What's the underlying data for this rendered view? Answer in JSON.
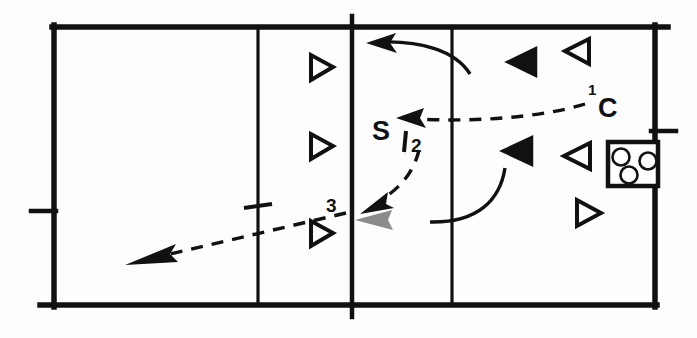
{
  "diagram": {
    "type": "court-drill",
    "court": {
      "outline": {
        "x": 52,
        "y": 25,
        "width": 603,
        "height": 280
      },
      "net_line_x": 352,
      "attack_line_left_x": 258,
      "attack_line_right_x": 452,
      "line_color": "#111111",
      "background_color": "#ffffff"
    },
    "labels": [
      {
        "id": "label-c",
        "text": "C",
        "role": "coach",
        "x": 607,
        "y": 113,
        "size": "big"
      },
      {
        "id": "label-c-sup",
        "text": "1",
        "role": "sequence-marker",
        "x": 590,
        "y": 94,
        "size": "sup"
      },
      {
        "id": "label-s",
        "text": "S",
        "role": "setter",
        "x": 378,
        "y": 135,
        "size": "big"
      },
      {
        "id": "label-2",
        "text": "2",
        "role": "sequence-marker",
        "x": 417,
        "y": 151,
        "size": "mid"
      },
      {
        "id": "label-3",
        "text": "3",
        "role": "sequence-marker",
        "x": 330,
        "y": 209,
        "size": "mid"
      }
    ],
    "players": [
      {
        "id": "player-open-right-1",
        "style": "hollow",
        "direction": "right",
        "x": 310,
        "y": 55
      },
      {
        "id": "player-open-right-2",
        "style": "hollow",
        "direction": "right",
        "x": 310,
        "y": 134
      },
      {
        "id": "player-open-right-3",
        "style": "hollow",
        "direction": "right",
        "x": 310,
        "y": 221
      },
      {
        "id": "player-filled-left-1",
        "style": "filled",
        "direction": "left",
        "x": 535,
        "y": 48
      },
      {
        "id": "player-filled-left-2",
        "style": "filled",
        "direction": "left",
        "x": 531,
        "y": 137
      },
      {
        "id": "player-open-left-1",
        "style": "hollow",
        "direction": "left",
        "x": 589,
        "y": 39
      },
      {
        "id": "player-open-left-2",
        "style": "hollow",
        "direction": "left",
        "x": 589,
        "y": 142
      },
      {
        "id": "player-open-right-4",
        "style": "hollow",
        "direction": "right",
        "x": 575,
        "y": 200
      }
    ],
    "ball_cart": {
      "id": "ball-cart",
      "x": 608,
      "y": 142,
      "width": 50,
      "height": 44,
      "ball_count": 3
    },
    "paths": [
      {
        "id": "path-coach-toss",
        "style": "dashed",
        "label": "1",
        "description": "coach toss to setter",
        "arrow": "solid"
      },
      {
        "id": "path-set",
        "style": "dashed",
        "label": "2",
        "description": "setter set to attacker",
        "arrow": "solid"
      },
      {
        "id": "path-attack",
        "style": "dashed",
        "label": "3",
        "description": "attack across the net",
        "arrow": "solid"
      },
      {
        "id": "path-hitter-approach-top",
        "style": "solid",
        "description": "hitter movement upper court",
        "arrow": "solid"
      },
      {
        "id": "path-hitter-approach-bottom",
        "style": "solid",
        "description": "hitter movement lower court",
        "arrow": "gray"
      }
    ],
    "ticks": [
      {
        "id": "tick-left-sideline",
        "x": 30,
        "y": 210
      },
      {
        "id": "tick-right-sideline",
        "x": 655,
        "y": 130
      }
    ]
  }
}
